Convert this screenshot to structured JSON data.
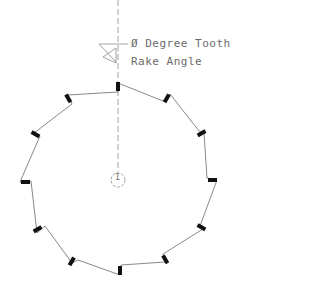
{
  "diagram": {
    "title_line1": "Ø Degree Tooth",
    "title_line2": "Rake Angle",
    "center_symbol": "1",
    "tooth_count": 12,
    "colors": {
      "outline": "#7a7a7a",
      "tip": "#111111",
      "text": "#6a6a6a",
      "background": "#ffffff"
    }
  }
}
